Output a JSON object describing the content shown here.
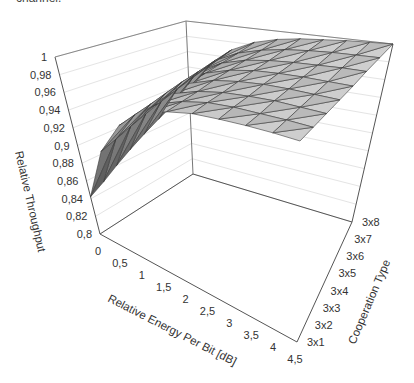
{
  "caption_fragment": "channel.",
  "chart_data": {
    "type": "surface3d",
    "title": "",
    "xlabel": "Relative Energy Per Bit [dB]",
    "ylabel": "Cooperation Type",
    "zlabel": "Relative Throughput",
    "x_ticks": [
      "0",
      "0,5",
      "1",
      "1,5",
      "2",
      "2,5",
      "3",
      "3,5",
      "4",
      "4,5"
    ],
    "y_ticks": [
      "3x1",
      "3x2",
      "3x3",
      "3x4",
      "3x5",
      "3x6",
      "3x7",
      "3x8"
    ],
    "z_ticks": [
      "0,8",
      "0,82",
      "0,84",
      "0,86",
      "0,88",
      "0,9",
      "0,92",
      "0,94",
      "0,96",
      "0,98",
      "1"
    ],
    "x": [
      0,
      0.5,
      1,
      1.5,
      2,
      2.5,
      3,
      3.5,
      4,
      4.5
    ],
    "y": [
      "3x1",
      "3x2",
      "3x3",
      "3x4",
      "3x5",
      "3x6",
      "3x7",
      "3x8"
    ],
    "zlim": [
      0.8,
      1.0
    ],
    "grid": true,
    "surface_color": "grayscale",
    "z_values_by_y": [
      [
        0.842,
        0.905,
        0.945,
        0.968,
        0.981,
        0.989,
        0.993,
        0.996,
        0.998,
        0.999
      ],
      [
        0.85,
        0.91,
        0.948,
        0.97,
        0.982,
        0.99,
        0.994,
        0.996,
        0.998,
        0.999
      ],
      [
        0.86,
        0.916,
        0.951,
        0.972,
        0.983,
        0.99,
        0.994,
        0.997,
        0.998,
        0.999
      ],
      [
        0.87,
        0.922,
        0.955,
        0.974,
        0.985,
        0.991,
        0.995,
        0.997,
        0.998,
        0.999
      ],
      [
        0.88,
        0.928,
        0.959,
        0.976,
        0.986,
        0.992,
        0.995,
        0.997,
        0.998,
        0.999
      ],
      [
        0.89,
        0.934,
        0.962,
        0.978,
        0.987,
        0.992,
        0.995,
        0.997,
        0.999,
        1.0
      ],
      [
        0.9,
        0.94,
        0.966,
        0.98,
        0.988,
        0.993,
        0.996,
        0.998,
        0.999,
        1.0
      ],
      [
        0.91,
        0.946,
        0.97,
        0.983,
        0.99,
        0.994,
        0.996,
        0.998,
        0.999,
        1.0
      ]
    ]
  }
}
